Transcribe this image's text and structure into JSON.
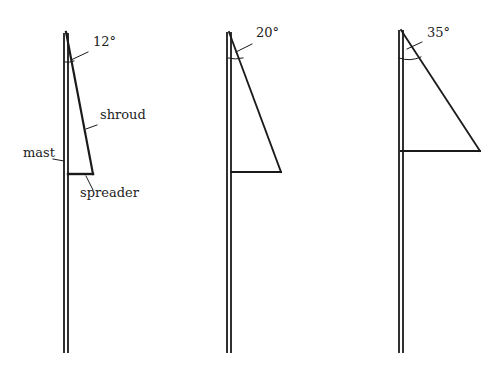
{
  "diagrams": [
    {
      "angle_label": "12°",
      "labels": {
        "shroud": "shroud",
        "mast": "mast",
        "spreader": "spreader"
      }
    },
    {
      "angle_label": "20°"
    },
    {
      "angle_label": "35°"
    }
  ],
  "colors": {
    "line": "#1a1a1a",
    "background": "#ffffff"
  }
}
